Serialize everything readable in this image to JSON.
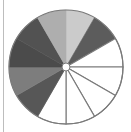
{
  "diagram": {
    "type": "fraction-circle",
    "title": "",
    "total_parts": 12,
    "shaded_parts": 7,
    "unshaded_parts": 5,
    "fraction_shaded": "7/12",
    "center": [
      66,
      67
    ],
    "radius": 57,
    "hole_radius": 4,
    "outline_color": "#7a7a7a",
    "sectors": [
      {
        "index": 1,
        "start_deg": 0,
        "end_deg": 30,
        "fill": "#cbcbcb",
        "shaded": true
      },
      {
        "index": 2,
        "start_deg": 30,
        "end_deg": 60,
        "fill": "#5c5c5c",
        "shaded": true
      },
      {
        "index": 3,
        "start_deg": 60,
        "end_deg": 90,
        "fill": "#ffffff",
        "shaded": false
      },
      {
        "index": 4,
        "start_deg": 90,
        "end_deg": 120,
        "fill": "#ffffff",
        "shaded": false
      },
      {
        "index": 5,
        "start_deg": 120,
        "end_deg": 150,
        "fill": "#ffffff",
        "shaded": false
      },
      {
        "index": 6,
        "start_deg": 150,
        "end_deg": 180,
        "fill": "#ffffff",
        "shaded": false
      },
      {
        "index": 7,
        "start_deg": 180,
        "end_deg": 210,
        "fill": "#ffffff",
        "shaded": false
      },
      {
        "index": 8,
        "start_deg": 210,
        "end_deg": 240,
        "fill": "#575757",
        "shaded": true
      },
      {
        "index": 9,
        "start_deg": 240,
        "end_deg": 270,
        "fill": "#7d7d7d",
        "shaded": true
      },
      {
        "index": 10,
        "start_deg": 270,
        "end_deg": 300,
        "fill": "#4b4b4b",
        "shaded": true
      },
      {
        "index": 11,
        "start_deg": 300,
        "end_deg": 330,
        "fill": "#525252",
        "shaded": true
      },
      {
        "index": 12,
        "start_deg": 330,
        "end_deg": 360,
        "fill": "#aeaeae",
        "shaded": true
      }
    ]
  }
}
